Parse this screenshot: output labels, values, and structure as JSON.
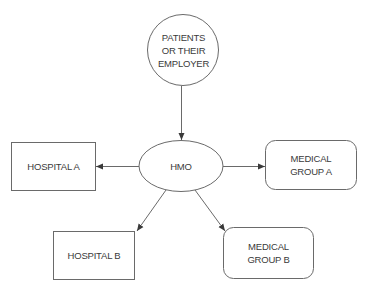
{
  "diagram": {
    "colors": {
      "stroke": "#6a6a6a",
      "arrow": "#3a3a3a",
      "text": "#3a3a3a",
      "background": "#ffffff"
    },
    "nodes": {
      "patients": {
        "shape": "circle",
        "lines": [
          "PATIENTS",
          "OR THEIR",
          "EMPLOYER"
        ]
      },
      "hmo": {
        "shape": "ellipse",
        "lines": [
          "HMO"
        ]
      },
      "hospital_a": {
        "shape": "rectangle",
        "lines": [
          "HOSPITAL A"
        ]
      },
      "hospital_b": {
        "shape": "rectangle",
        "lines": [
          "HOSPITAL B"
        ]
      },
      "medical_group_a": {
        "shape": "rounded-rectangle",
        "lines": [
          "MEDICAL",
          "GROUP A"
        ]
      },
      "medical_group_b": {
        "shape": "rounded-rectangle",
        "lines": [
          "MEDICAL",
          "GROUP B"
        ]
      }
    },
    "edges": [
      {
        "from": "PATIENTS OR THEIR EMPLOYER",
        "to": "HMO"
      },
      {
        "from": "HMO",
        "to": "HOSPITAL A"
      },
      {
        "from": "HMO",
        "to": "MEDICAL GROUP A"
      },
      {
        "from": "HMO",
        "to": "HOSPITAL B"
      },
      {
        "from": "HMO",
        "to": "MEDICAL GROUP B"
      }
    ]
  }
}
